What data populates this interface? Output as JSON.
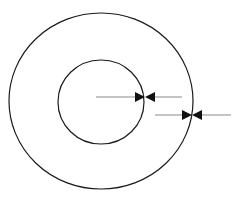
{
  "diagram": {
    "background": "#ffffff",
    "stroke_color": "#1a1a1a",
    "arrow_line_color": "#8a8a8a",
    "outer_circle": {
      "cx": 101,
      "cy": 101,
      "rx": 92,
      "ry": 88
    },
    "inner_circle": {
      "cx": 101,
      "cy": 102,
      "rx": 43,
      "ry": 42
    },
    "arrows": [
      {
        "name": "inner-radius-arrow",
        "y": 97,
        "x_start": 96,
        "x_end": 182,
        "meet_x": 145
      },
      {
        "name": "outer-radius-arrow",
        "y": 115,
        "x_start": 155,
        "x_end": 231,
        "meet_x": 192
      }
    ]
  }
}
